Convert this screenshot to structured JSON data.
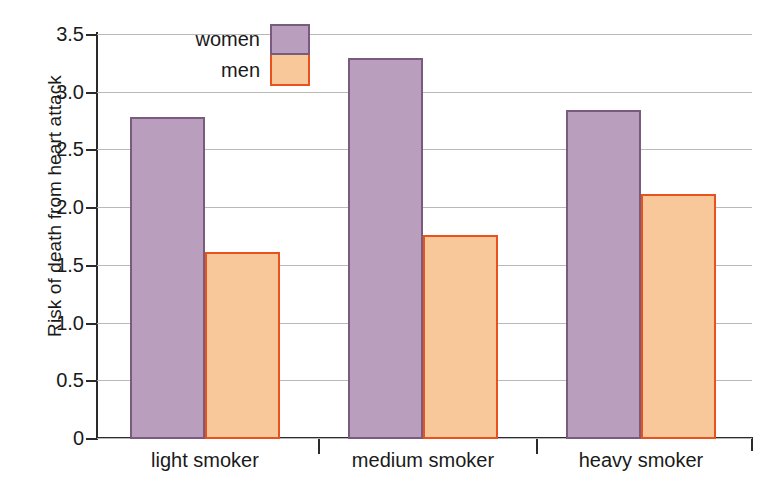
{
  "chart_data": {
    "type": "bar",
    "title": "",
    "xlabel": "",
    "ylabel": "Risk of death from heart attack",
    "categories": [
      "light smoker",
      "medium smoker",
      "heavy smoker"
    ],
    "series": [
      {
        "name": "women",
        "values": [
          2.78,
          3.29,
          2.84
        ],
        "color": "#b99ebd",
        "border_color": "#7a5a7e"
      },
      {
        "name": "men",
        "values": [
          1.61,
          1.76,
          2.11
        ],
        "color": "#f8c79a",
        "border_color": "#e8521e"
      }
    ],
    "ylim": [
      0,
      3.5
    ],
    "ytick_values": [
      0,
      0.5,
      1.0,
      1.5,
      2.0,
      2.5,
      3.0,
      3.5
    ],
    "ytick_labels": [
      "0",
      "0.5",
      "1.0",
      "1.5",
      "2.0",
      "2.5",
      "3.0",
      "3.5"
    ],
    "grid": true,
    "legend_position": "top-left-inside",
    "legend_entries": [
      "women",
      "men"
    ]
  }
}
